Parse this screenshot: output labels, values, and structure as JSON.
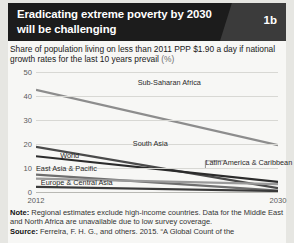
{
  "header": {
    "title": "Eradicating extreme poverty by 2030 will be challenging",
    "badge": "1b"
  },
  "subtitle": {
    "text": "Share of population living on less than 2011 PPP $1.90 a day if national growth rates for the last 10 years prevail",
    "unit": "(%)"
  },
  "footer": {
    "note_label": "Note:",
    "note_text": " Regional estimates exclude high-income countries. Data for the Middle East and North Africa are unavailable due to low survey coverage.",
    "source_label": "Source:",
    "source_text": " Ferreira, F. H. G., and others. 2015. “A Global Count of the"
  },
  "chart_data": {
    "type": "line",
    "title": "Eradicating extreme poverty by 2030 will be challenging",
    "xlabel": "",
    "ylabel": "",
    "unit": "(%)",
    "x": [
      2012,
      2030
    ],
    "xticks": [
      "2012",
      "2030"
    ],
    "yticks": [
      "50",
      "40",
      "30",
      "20",
      "10",
      "0"
    ],
    "ylim": [
      0,
      50
    ],
    "xlim": [
      2012,
      2030
    ],
    "grid": true,
    "legend": "inline-labels",
    "series": [
      {
        "name": "Sub-Saharan Africa",
        "values": [
          42.6,
          19.5
        ],
        "color": "#8d8d8d"
      },
      {
        "name": "South Asia",
        "values": [
          18.8,
          1.6
        ],
        "color": "#4a4a4a"
      },
      {
        "name": "World",
        "values": [
          14.9,
          4.2
        ],
        "color": "#2b2b2b"
      },
      {
        "name": "East Asia & Pacific",
        "values": [
          7.2,
          0.6
        ],
        "color": "#6e6e6e"
      },
      {
        "name": "Latin America & Caribbean",
        "values": [
          5.6,
          3.3
        ],
        "color": "#9a9a9a"
      },
      {
        "name": "Europe & Central Asia",
        "values": [
          2.1,
          0.4
        ],
        "color": "#3a3a3a"
      }
    ],
    "annotations": [
      {
        "text": "Sub-Saharan Africa",
        "x_pct": 42,
        "y_pct": 5
      },
      {
        "text": "South Asia",
        "x_pct": 40,
        "y_pct": 56
      },
      {
        "text": "World",
        "x_pct": 10,
        "y_pct": 66
      },
      {
        "text": "East Asia & Pacific",
        "x_pct": 0,
        "y_pct": 77
      },
      {
        "text": "Europe & Central Asia",
        "x_pct": 2,
        "y_pct": 88
      },
      {
        "text": "Latin America & Caribbean",
        "x_pct": 70,
        "y_pct": 72
      }
    ]
  }
}
